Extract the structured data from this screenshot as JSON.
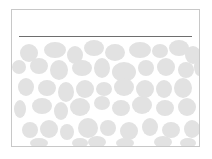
{
  "slide": {
    "title": "",
    "rule_color": "#6e6e6e",
    "pattern_color": "#e2e2e2",
    "pattern": "pebble-blobs",
    "blobs": [
      [
        8,
        6,
        18,
        18
      ],
      [
        32,
        4,
        22,
        16
      ],
      [
        55,
        8,
        16,
        18
      ],
      [
        72,
        2,
        20,
        16
      ],
      [
        93,
        6,
        20,
        17
      ],
      [
        117,
        4,
        22,
        16
      ],
      [
        140,
        6,
        16,
        14
      ],
      [
        157,
        2,
        20,
        16
      ],
      [
        173,
        8,
        16,
        18
      ],
      [
        0,
        22,
        14,
        14
      ],
      [
        18,
        20,
        18,
        16
      ],
      [
        38,
        22,
        18,
        20
      ],
      [
        60,
        22,
        20,
        16
      ],
      [
        82,
        20,
        16,
        20
      ],
      [
        100,
        24,
        24,
        20
      ],
      [
        126,
        22,
        16,
        16
      ],
      [
        145,
        20,
        18,
        18
      ],
      [
        166,
        24,
        16,
        16
      ],
      [
        182,
        20,
        10,
        18
      ],
      [
        6,
        40,
        16,
        18
      ],
      [
        26,
        42,
        18,
        16
      ],
      [
        46,
        44,
        16,
        20
      ],
      [
        64,
        42,
        18,
        18
      ],
      [
        84,
        44,
        16,
        14
      ],
      [
        102,
        40,
        20,
        18
      ],
      [
        124,
        42,
        18,
        18
      ],
      [
        144,
        42,
        16,
        18
      ],
      [
        162,
        40,
        18,
        20
      ],
      [
        2,
        62,
        12,
        18
      ],
      [
        20,
        60,
        20,
        16
      ],
      [
        42,
        64,
        14,
        18
      ],
      [
        58,
        60,
        20,
        18
      ],
      [
        82,
        58,
        16,
        14
      ],
      [
        100,
        62,
        18,
        16
      ],
      [
        120,
        58,
        20,
        18
      ],
      [
        144,
        62,
        18,
        16
      ],
      [
        166,
        60,
        18,
        18
      ],
      [
        10,
        84,
        16,
        16
      ],
      [
        28,
        82,
        18,
        18
      ],
      [
        48,
        86,
        14,
        16
      ],
      [
        66,
        80,
        20,
        20
      ],
      [
        88,
        82,
        16,
        16
      ],
      [
        108,
        84,
        18,
        18
      ],
      [
        130,
        80,
        16,
        18
      ],
      [
        150,
        84,
        18,
        16
      ],
      [
        172,
        82,
        16,
        18
      ],
      [
        18,
        100,
        18,
        10
      ],
      [
        60,
        100,
        16,
        10
      ],
      [
        76,
        98,
        18,
        12
      ],
      [
        104,
        100,
        18,
        10
      ],
      [
        142,
        98,
        18,
        12
      ],
      [
        168,
        100,
        16,
        10
      ]
    ]
  }
}
